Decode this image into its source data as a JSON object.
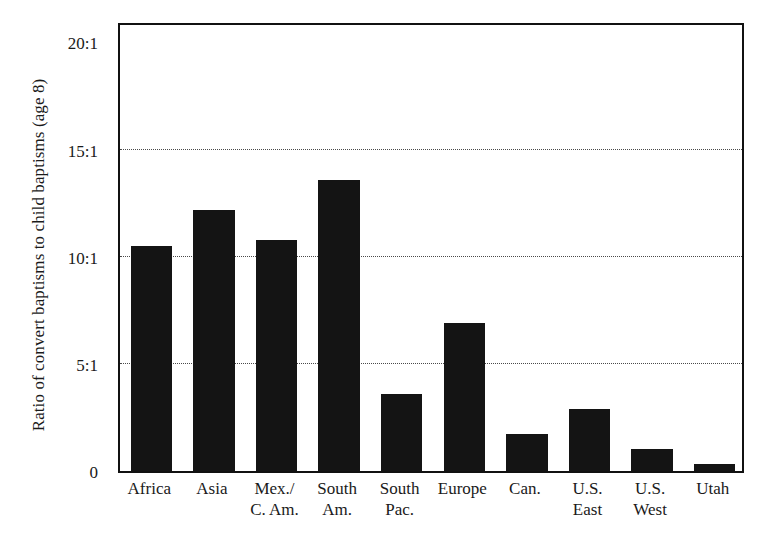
{
  "chart_data": {
    "type": "bar",
    "title": "",
    "subtitle": "",
    "xlabel": "",
    "ylabel": "Ratio of convert baptisms to child baptisms (age 8)",
    "categories": [
      "Africa",
      "Asia",
      "Mex./ C. Am.",
      "South Am.",
      "South Pac.",
      "Europe",
      "Can.",
      "U.S. East",
      "U.S. West",
      "Utah"
    ],
    "category_lines": [
      [
        "Africa",
        ""
      ],
      [
        "Asia",
        ""
      ],
      [
        "Mex./",
        "C. Am."
      ],
      [
        "South",
        "Am."
      ],
      [
        "South",
        "Pac."
      ],
      [
        "Europe",
        ""
      ],
      [
        "Can.",
        ""
      ],
      [
        "U.S.",
        "East"
      ],
      [
        "U.S.",
        "West"
      ],
      [
        "Utah",
        ""
      ]
    ],
    "values": [
      10.5,
      12.2,
      10.8,
      13.6,
      3.6,
      6.9,
      1.75,
      2.9,
      1.05,
      0.35
    ],
    "ylim": [
      0,
      21
    ],
    "yticks": [
      0,
      5,
      10,
      15,
      20
    ],
    "ytick_labels": [
      "0",
      "5:1",
      "10:1",
      "15:1",
      "20:1"
    ],
    "gridlines_at": [
      5,
      10,
      15
    ],
    "grid": true,
    "grid_style": "dotted",
    "legend": "none",
    "bar_color": "#141414",
    "axis_color": "#111111",
    "background_color": "#ffffff"
  },
  "axis": {
    "y_title": "Ratio of convert baptisms to child baptisms (age 8)"
  }
}
